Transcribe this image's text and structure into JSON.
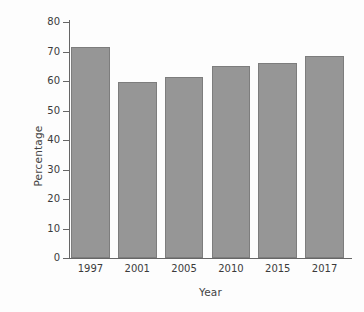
{
  "chart_data": {
    "type": "bar",
    "title": "",
    "xlabel": "Year",
    "ylabel": "Percentage",
    "categories": [
      "1997",
      "2001",
      "2005",
      "2010",
      "2015",
      "2017"
    ],
    "values": [
      71.5,
      59.5,
      61.5,
      65,
      66,
      68.5
    ],
    "ylim": [
      0,
      80
    ],
    "yticks": [
      0,
      10,
      20,
      30,
      40,
      50,
      60,
      70,
      80
    ],
    "ytick_labels": [
      "0",
      "10",
      "20",
      "30",
      "40",
      "50",
      "60",
      "70",
      "80"
    ],
    "grid": false,
    "legend": null,
    "bar_color": "#969696",
    "bar_edge_color": "#7d7d7d",
    "axis_color": "#666666",
    "text_color": "#3b3b3b",
    "background": "#fdfdfd"
  }
}
